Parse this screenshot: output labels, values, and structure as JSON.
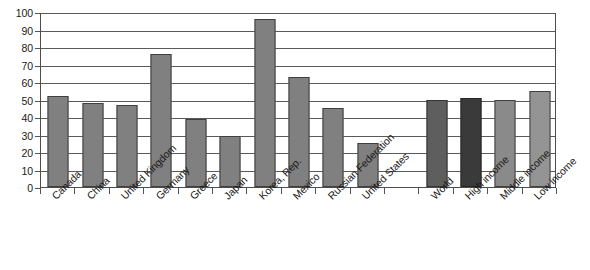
{
  "chart_data": {
    "type": "bar",
    "title": "",
    "subtitle": "",
    "xlabel": "",
    "ylabel": "",
    "ylim": [
      0,
      100
    ],
    "ytick_step": 10,
    "yticks": [
      100,
      90,
      80,
      70,
      60,
      50,
      40,
      30,
      20,
      10,
      0
    ],
    "ytick_labels": [
      "100",
      "90",
      "80",
      "70",
      "60",
      "50",
      "40",
      "30",
      "20",
      "10",
      "0"
    ],
    "grid": true,
    "grid_axis": "y",
    "legend": false,
    "legend_position": "none",
    "annotations": [],
    "categories": [
      "Canada",
      "China",
      "United Kingdom",
      "Germany",
      "Greece",
      "Japan",
      "Korea, Rep.",
      "Mexico",
      "Russian Federation",
      "United States",
      "",
      "World",
      "High income",
      "Middle income",
      "Low income"
    ],
    "values": [
      52,
      48,
      47,
      76,
      39,
      29,
      96,
      63,
      45,
      25,
      null,
      50,
      51,
      50,
      55
    ],
    "bar_colors": [
      "#808080",
      "#808080",
      "#808080",
      "#808080",
      "#808080",
      "#808080",
      "#808080",
      "#808080",
      "#808080",
      "#808080",
      "none",
      "#5e5e5e",
      "#3a3a3a",
      "#8a8a8a",
      "#949494"
    ],
    "bar_shade_classes": [
      "shade-default",
      "shade-default",
      "shade-default",
      "shade-default",
      "shade-default",
      "shade-default",
      "shade-default",
      "shade-default",
      "shade-default",
      "shade-default",
      "none",
      "shade-dark",
      "shade-darkest",
      "shade-light",
      "shade-lighter"
    ],
    "axis_color": "#4d4d4d",
    "gridline_color": "#5a5a5a",
    "background_color": "#ffffff"
  }
}
